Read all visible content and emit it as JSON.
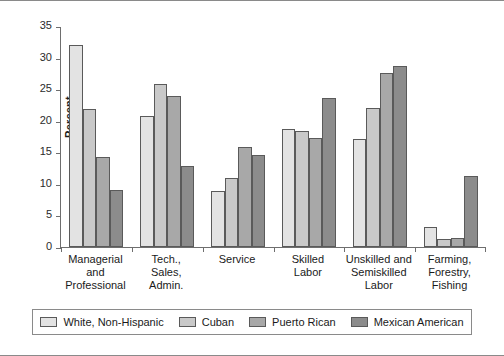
{
  "chart_data": {
    "type": "bar",
    "title": "",
    "subtitle": "",
    "xlabel": "",
    "ylabel": "Percent",
    "ylim": [
      0,
      35
    ],
    "yticks": [
      0,
      5,
      10,
      15,
      20,
      25,
      30,
      35
    ],
    "ytick_labels": [
      "0",
      "5",
      "10",
      "15",
      "20",
      "25",
      "30",
      "35"
    ],
    "grid": false,
    "legend_position": "bottom",
    "categories": [
      "Managerial\nand\nProfessional",
      "Tech.,\nSales,\nAdmin.",
      "Service",
      "Skilled\nLabor",
      "Unskilled and\nSemiskilled\nLabor",
      "Farming,\nForestry,\nFishing"
    ],
    "series": [
      {
        "name": "White, Non-Hispanic",
        "color": "#e3e3e3",
        "values": [
          32.0,
          20.7,
          8.8,
          18.7,
          17.1,
          3.1
        ]
      },
      {
        "name": "Cuban",
        "color": "#c9c9c9",
        "values": [
          21.8,
          25.8,
          11.0,
          18.4,
          22.0,
          1.2
        ]
      },
      {
        "name": "Puerto Rican",
        "color": "#a8a8a8",
        "values": [
          14.3,
          23.9,
          15.9,
          17.2,
          27.5,
          1.4
        ]
      },
      {
        "name": "Mexican American",
        "color": "#8c8c8c",
        "values": [
          9.0,
          12.8,
          14.6,
          23.6,
          28.7,
          11.3
        ]
      }
    ]
  },
  "legend": {
    "items": [
      {
        "label": "White, Non-Hispanic",
        "color": "#e3e3e3"
      },
      {
        "label": "Cuban",
        "color": "#c9c9c9"
      },
      {
        "label": "Puerto Rican",
        "color": "#a8a8a8"
      },
      {
        "label": "Mexican American",
        "color": "#8c8c8c"
      }
    ]
  },
  "colors": {
    "axis": "#6e6e6e",
    "bar_outline": "#5a5a5a",
    "frame": "#8a8a8a",
    "text": "#1a1a1a",
    "background": "#ffffff"
  }
}
